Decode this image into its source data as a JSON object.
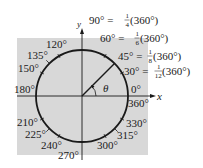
{
  "figure": {
    "background": "#ffffff",
    "panel_color": "#d8d8d8",
    "stroke_color": "#1a1a1a",
    "axes": {
      "x_label": "x",
      "y_label": "y"
    },
    "angle_label": "θ",
    "equations": [
      {
        "id": "eq90",
        "lhs": "90° =",
        "num": "1",
        "den": "4",
        "rhs": "(360°)"
      },
      {
        "id": "eq60",
        "lhs": "60° =",
        "num": "1",
        "den": "6",
        "rhs": "(360°)"
      },
      {
        "id": "eq45",
        "lhs": "45° =",
        "num": "1",
        "den": "8",
        "rhs": "(360°)"
      },
      {
        "id": "eq30",
        "lhs": "30° =",
        "num": "1",
        "den": "12",
        "rhs": "(360°)"
      }
    ],
    "angle_labels": {
      "a0": "0°",
      "a360": "360°",
      "a120": "120°",
      "a135": "135°",
      "a150": "150°",
      "a180": "180°",
      "a210": "210°",
      "a225": "225°",
      "a240": "240°",
      "a270": "270°",
      "a300": "300°",
      "a315": "315°",
      "a330": "330°"
    }
  }
}
